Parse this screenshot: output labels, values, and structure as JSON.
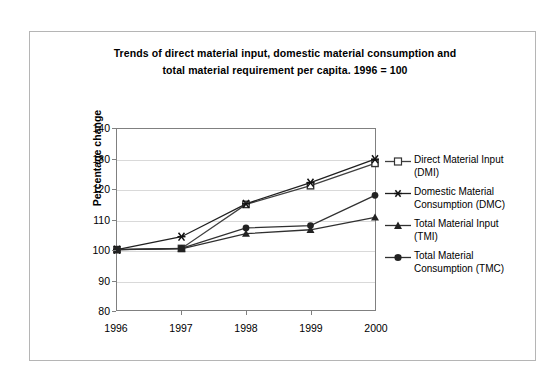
{
  "chart_data": {
    "type": "line",
    "title": "Trends of direct material input, domestic material consumption and total material requirement per capita. 1996 = 100",
    "title_lines": [
      "Trends of direct material input, domestic material consumption and",
      "total material requirement per capita. 1996 = 100"
    ],
    "xlabel": "",
    "ylabel": "Percentage change",
    "categories": [
      "1996",
      "1997",
      "1998",
      "1999",
      "2000"
    ],
    "x": [
      1996,
      1997,
      1998,
      1999,
      2000
    ],
    "ylim": [
      80,
      140
    ],
    "yticks": [
      80,
      90,
      100,
      110,
      120,
      130,
      140
    ],
    "ytick_labels": [
      "80",
      "90",
      "100",
      "110",
      "120",
      "130",
      "140"
    ],
    "grid": "horizontal",
    "legend_position": "right",
    "series": [
      {
        "name": "Direct Material Input (DMI)",
        "short": "DMI",
        "marker": "square-open",
        "color": "#404040",
        "values": [
          100.0,
          100.4,
          115.0,
          121.2,
          128.6
        ],
        "legend_lines": [
          "Direct Material Input",
          "(DMI)"
        ]
      },
      {
        "name": "Domestic Material Consumption (DMC)",
        "short": "DMC",
        "marker": "star",
        "color": "#202020",
        "values": [
          100.0,
          104.3,
          115.2,
          122.2,
          130.0
        ],
        "legend_lines": [
          "Domestic Material",
          "Consumption (DMC)"
        ]
      },
      {
        "name": "Total Material Input (TMI)",
        "short": "TMI",
        "marker": "triangle-filled",
        "color": "#303030",
        "values": [
          100.0,
          100.3,
          105.3,
          106.6,
          110.7
        ],
        "legend_lines": [
          "Total Material Input",
          "(TMI)"
        ]
      },
      {
        "name": "Total Material Consumption (TMC)",
        "short": "TMC",
        "marker": "circle-filled",
        "color": "#303030",
        "values": [
          100.0,
          100.4,
          107.2,
          108.0,
          118.0
        ],
        "legend_lines": [
          "Total Material",
          "Consumption (TMC)"
        ]
      }
    ],
    "colors": {
      "axis": "#808080",
      "grid": "#d9d9d9",
      "frame": "#b5b5b5",
      "text": "#000000",
      "background": "#ffffff"
    }
  }
}
